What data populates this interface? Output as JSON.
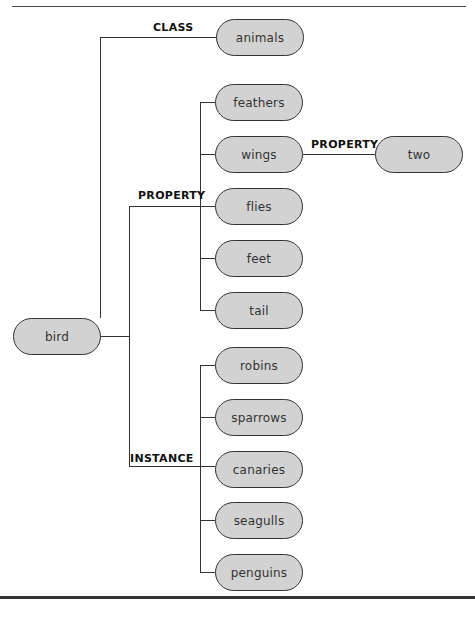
{
  "diagram": {
    "type": "semantic-network",
    "root": {
      "label": "bird"
    },
    "edges": {
      "class": {
        "label": "CLASS"
      },
      "property": {
        "label": "PROPERTY"
      },
      "instance": {
        "label": "INSTANCE"
      },
      "wings_property": {
        "label": "PROPERTY"
      }
    },
    "class_node": {
      "label": "animals"
    },
    "properties": [
      {
        "label": "feathers"
      },
      {
        "label": "wings"
      },
      {
        "label": "flies"
      },
      {
        "label": "feet"
      },
      {
        "label": "tail"
      }
    ],
    "wings_property_value": {
      "label": "two"
    },
    "instances": [
      {
        "label": "robins"
      },
      {
        "label": "sparrows"
      },
      {
        "label": "canaries"
      },
      {
        "label": "seagulls"
      },
      {
        "label": "penguins"
      }
    ]
  }
}
